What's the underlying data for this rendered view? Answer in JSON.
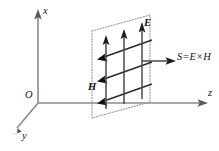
{
  "figure": {
    "background_color": "#ffffff",
    "axes": {
      "x": {
        "label": "x",
        "direction": "up",
        "icon": "arrow-up-icon",
        "color": "#8a8a8a"
      },
      "y": {
        "label": "y",
        "direction": "down-left",
        "icon": "arrow-down-left-icon",
        "color": "#8a8a8a"
      },
      "z": {
        "label": "z",
        "direction": "right",
        "icon": "arrow-right-icon",
        "color": "#8a8a8a"
      },
      "origin": {
        "label": "O"
      }
    },
    "wavefront_plane": {
      "name": "wave-front-plane",
      "edge_style": "dotted",
      "edge_color": "#9a9a9a",
      "fill": "none"
    },
    "fields": {
      "electric": {
        "label": "E",
        "description": "Electric field vectors pointing along +x",
        "count": 3,
        "color": "#1d1d1d"
      },
      "magnetic": {
        "label": "H",
        "description": "Magnetic field vectors pointing along -y",
        "count": 3,
        "color": "#111111"
      },
      "poynting": {
        "label": "S=E×H",
        "description": "Poynting vector pointing along +z",
        "color": "#1d1d1d"
      }
    }
  }
}
